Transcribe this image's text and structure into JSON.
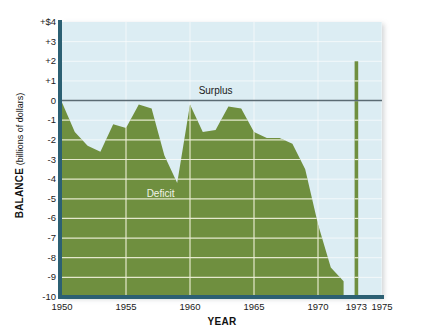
{
  "chart_data": {
    "type": "area",
    "title": "",
    "xlabel": "YEAR",
    "ylabel": "BALANCE",
    "ylabel_unit": "(billions of dollars)",
    "ylim": [
      -10,
      4
    ],
    "xlim": [
      1950,
      1975
    ],
    "grid": true,
    "gridline_color": "#eef0d8",
    "area_color": "#6f8f3f",
    "plot_background": "#dcedf3",
    "axis_color": "#2c6073",
    "zero_line_color": "#5b6b73",
    "y_ticks": [
      "+$4",
      "+3",
      "+2",
      "+1",
      "0",
      "-1",
      "-2",
      "-3",
      "-4",
      "-5",
      "-6",
      "-7",
      "-8",
      "-9",
      "-10"
    ],
    "y_tick_values": [
      4,
      3,
      2,
      1,
      0,
      -1,
      -2,
      -3,
      -4,
      -5,
      -6,
      -7,
      -8,
      -9,
      -10
    ],
    "x_ticks": [
      "1950",
      "1955",
      "1960",
      "1965",
      "1970",
      "1973",
      "1975"
    ],
    "x_tick_values": [
      1950,
      1955,
      1960,
      1965,
      1970,
      1973,
      1975
    ],
    "annotations": [
      {
        "text": "Surplus",
        "x": 1962.0,
        "y": 0.45
      },
      {
        "text": "Deficit",
        "x": 1957.7,
        "y": -4.8
      }
    ],
    "x": [
      1950,
      1951,
      1952,
      1953,
      1954,
      1955,
      1956,
      1957,
      1958,
      1959,
      1960,
      1961,
      1962,
      1963,
      1964,
      1965,
      1966,
      1967,
      1968,
      1969,
      1970,
      1971,
      1972
    ],
    "values": [
      -0.1,
      -1.6,
      -2.3,
      -2.6,
      -1.2,
      -1.4,
      -0.2,
      -0.4,
      -2.8,
      -4.2,
      -0.2,
      -1.6,
      -1.5,
      -0.3,
      -0.4,
      -1.6,
      -1.9,
      -1.9,
      -2.2,
      -3.5,
      -6.3,
      -8.5,
      -9.2
    ],
    "spike": {
      "x": 1973,
      "y": 2.0,
      "label": "1973",
      "kind": "isolated-bar"
    },
    "series_name": "Balance of payments"
  },
  "figure": {
    "y_axis_title_main": "BALANCE",
    "y_axis_title_sub": "(billions of dollars)"
  }
}
